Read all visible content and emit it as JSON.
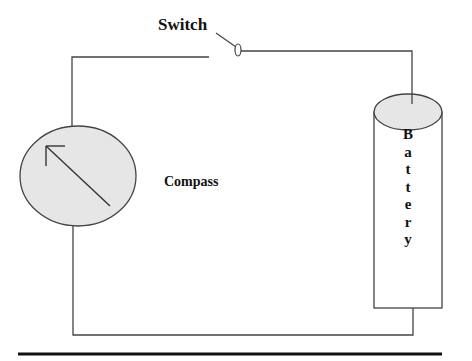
{
  "diagram": {
    "title": "",
    "labels": {
      "switch": "Switch",
      "compass": "Compass",
      "battery": "Battery"
    },
    "battery_letters": [
      "B",
      "a",
      "t",
      "t",
      "e",
      "r",
      "y"
    ],
    "components": [
      {
        "id": "switch",
        "type": "open-switch",
        "label": "Switch"
      },
      {
        "id": "compass",
        "type": "compass",
        "label": "Compass",
        "needle_direction": "north-west"
      },
      {
        "id": "battery",
        "type": "cylinder-battery",
        "label": "Battery"
      }
    ],
    "connections": [
      {
        "from": "compass",
        "to": "switch",
        "path": "up-left then right along top"
      },
      {
        "from": "switch",
        "to": "battery",
        "path": "right then down to battery top"
      },
      {
        "from": "battery",
        "to": "compass",
        "path": "down from battery bottom, left along bottom, up to compass"
      }
    ],
    "colors": {
      "wire": "#444444",
      "fill": "#e6e6e6",
      "text": "#111111",
      "rule": "#111111"
    }
  }
}
